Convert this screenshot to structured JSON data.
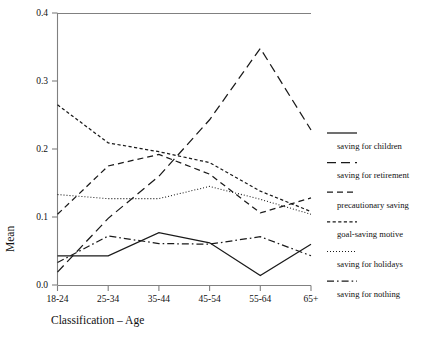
{
  "chart_data": {
    "type": "line",
    "title": "",
    "xlabel": "Classification – Age",
    "ylabel": "Mean",
    "categories": [
      "18-24",
      "25-34",
      "35-44",
      "45-54",
      "55-64",
      "65+"
    ],
    "ylim": [
      0.0,
      0.4
    ],
    "yticks": [
      "0.0",
      "0.1",
      "0.2",
      "0.3",
      "0.4"
    ],
    "ytick_values": [
      0.0,
      0.1,
      0.2,
      0.3,
      0.4
    ],
    "grid": false,
    "legend_position": "right",
    "series": [
      {
        "name": "saving for children",
        "style": "solid",
        "values": [
          0.043,
          0.043,
          0.077,
          0.062,
          0.014,
          0.06
        ]
      },
      {
        "name": "saving for retirement",
        "style": "long-dash",
        "values": [
          0.019,
          0.098,
          0.16,
          0.243,
          0.348,
          0.228
        ]
      },
      {
        "name": "precautionary saving",
        "style": "dash",
        "values": [
          0.104,
          0.175,
          0.192,
          0.163,
          0.106,
          0.128
        ]
      },
      {
        "name": "goal-saving motive",
        "style": "short-dash",
        "values": [
          0.265,
          0.209,
          0.196,
          0.18,
          0.138,
          0.108
        ]
      },
      {
        "name": "saving for holidays",
        "style": "dotted",
        "values": [
          0.133,
          0.127,
          0.127,
          0.145,
          0.126,
          0.104
        ]
      },
      {
        "name": "saving for nothing",
        "style": "dash-dot",
        "values": [
          0.033,
          0.072,
          0.061,
          0.06,
          0.071,
          0.043
        ]
      }
    ]
  },
  "axes": {
    "y_label": "Mean",
    "x_label": "Classification – Age"
  }
}
